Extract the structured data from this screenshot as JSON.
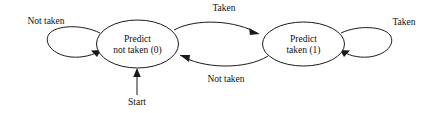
{
  "diagram": {
    "background_color": "#ffffff",
    "line_color": "#1a1a1a",
    "text_color": "#111111",
    "states": [
      {
        "id": "state-0",
        "line1": "Predict",
        "line2": "not taken (0)",
        "cx": 137.5,
        "cy": 44,
        "rx": 41,
        "ry": 24
      },
      {
        "id": "state-1",
        "line1": "Predict",
        "line2": "taken (1)",
        "cx": 303.5,
        "cy": 44,
        "rx": 41,
        "ry": 22
      }
    ],
    "transitions": [
      {
        "id": "self-loop-left",
        "label": "Not taken",
        "from": "state-0",
        "to": "state-0",
        "label_x": 46,
        "label_y": 24
      },
      {
        "id": "self-loop-right",
        "label": "Taken",
        "from": "state-1",
        "to": "state-1",
        "label_x": 404,
        "label_y": 25
      },
      {
        "id": "arc-top",
        "label": "Taken",
        "from": "state-0",
        "to": "state-1",
        "label_x": 224,
        "label_y": 11
      },
      {
        "id": "arc-bottom",
        "label": "Not taken",
        "from": "state-1",
        "to": "state-0",
        "label_x": 226,
        "label_y": 82
      }
    ],
    "start": {
      "label": "Start",
      "label_x": 137,
      "label_y": 105,
      "target_state": "state-0"
    }
  }
}
